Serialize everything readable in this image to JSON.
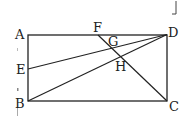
{
  "diagram": {
    "type": "geometry",
    "shape": "rectangle ABCD",
    "stroke_color": "#222222",
    "background": "#ffffff",
    "points": {
      "A": {
        "label": "A",
        "x": 28,
        "y": 35
      },
      "B": {
        "label": "B",
        "x": 28,
        "y": 101
      },
      "C": {
        "label": "C",
        "x": 167,
        "y": 101
      },
      "D": {
        "label": "D",
        "x": 167,
        "y": 34
      },
      "E": {
        "label": "E",
        "x": 28,
        "y": 69
      },
      "F": {
        "label": "F",
        "x": 98,
        "y": 35
      },
      "G": {
        "label": "G",
        "x": 112,
        "y": 46
      },
      "H": {
        "label": "H",
        "x": 121,
        "y": 57
      }
    },
    "segments": [
      "AB",
      "BC",
      "CD",
      "DA",
      "ED",
      "BD",
      "FC"
    ],
    "labels": {
      "A": "A",
      "B": "B",
      "C": "C",
      "D": "D",
      "E": "E",
      "F": "F",
      "G": "G",
      "H": "H"
    }
  }
}
